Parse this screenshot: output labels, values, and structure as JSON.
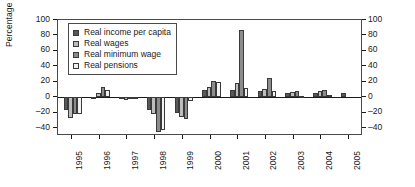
{
  "chart_data": {
    "type": "bar",
    "title": "",
    "xlabel": "",
    "ylabel": "Percentage change, year-on-year",
    "ylabel_right": "Percentage change, year-on-year",
    "ylim": [
      -50,
      100
    ],
    "yticks": [
      -40,
      -20,
      0,
      20,
      40,
      60,
      80,
      100
    ],
    "ytick_labels": [
      "–40",
      "–20",
      "0",
      "20",
      "40",
      "60",
      "80",
      "100"
    ],
    "grid": false,
    "legend_position": "top-left-inside",
    "dual_axis": true,
    "categories": [
      "1995",
      "1996",
      "1997",
      "1998",
      "1999",
      "2000",
      "2001",
      "2002",
      "2003",
      "2004",
      "2005"
    ],
    "series": [
      {
        "name": "Real income per capita",
        "color": "#595959",
        "values": [
          -17,
          1,
          -1,
          -17,
          -20,
          10,
          10,
          8,
          6,
          6,
          6
        ]
      },
      {
        "name": "Real wages",
        "color": "#bdbdbd",
        "values": [
          -27,
          6,
          -3,
          -21,
          -25,
          14,
          18,
          11,
          7,
          8,
          null
        ]
      },
      {
        "name": "Real minimum wage",
        "color": "#8c8c8c",
        "values": [
          -21,
          14,
          -1,
          -45,
          -28,
          21,
          87,
          25,
          8,
          9,
          null
        ]
      },
      {
        "name": "Real pensions",
        "color": "#f2f2f2",
        "values": [
          -22,
          10,
          -1,
          -42,
          -5,
          20,
          12,
          8,
          2,
          3,
          null
        ]
      }
    ]
  },
  "legend": {
    "items": [
      {
        "label": "Real income per capita",
        "swatch": "#595959"
      },
      {
        "label": "Real wages",
        "swatch": "#bdbdbd"
      },
      {
        "label": "Real minimum wage",
        "swatch": "#8c8c8c"
      },
      {
        "label": "Real pensions",
        "swatch": "#f2f2f2"
      }
    ]
  }
}
